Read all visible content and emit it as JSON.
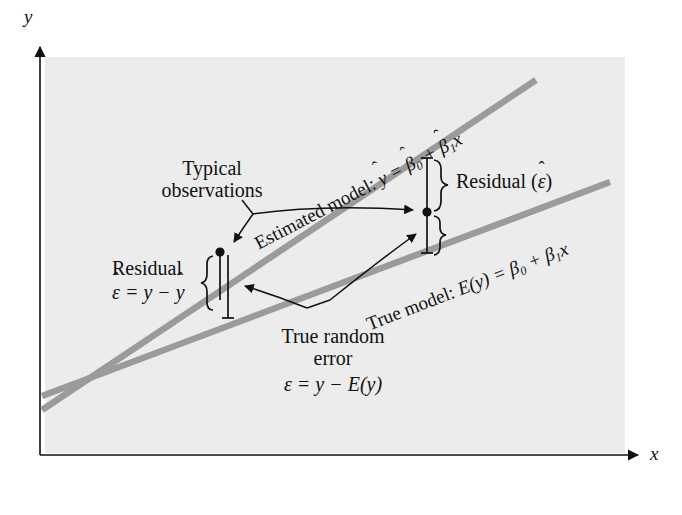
{
  "figure": {
    "type": "diagram",
    "background_color": "#ffffff",
    "plot_area_color": "#ececec",
    "line_color": "#9b9b9b",
    "ink_color": "#111111"
  },
  "axes": {
    "y_label": "y",
    "x_label": "x",
    "y_axis_name": "vertical-axis",
    "x_axis_name": "horizontal-axis"
  },
  "lines": [
    {
      "id": "estimated-model-line",
      "label_prefix": "Estimated model:",
      "equation_plain": "ŷ = β̂0 + β̂1x",
      "lhs": "y",
      "lhs_hat": "ˆ",
      "eq": " = ",
      "b0": "β",
      "b0_sub": "0",
      "b0_hat": "ˆ",
      "plus": " + ",
      "b1": "β",
      "b1_sub": "1",
      "b1_hat": "ˆ",
      "x": "x"
    },
    {
      "id": "true-model-line",
      "label_prefix": "True model:",
      "equation_plain": "E(y) = β0 + β1x",
      "lhs": "E(y)",
      "eq": " = ",
      "b0": "β",
      "b0_sub": "0",
      "plus": " + ",
      "b1": "β",
      "b1_sub": "1",
      "x": "x"
    }
  ],
  "annotations": {
    "typical_observations": {
      "line1": "Typical",
      "line2": "observations"
    },
    "residual_right": {
      "text": "Residual (",
      "symbol": "ε",
      "hat": "ˆ",
      "close": ")"
    },
    "residual_left": {
      "word": "Residual",
      "brace": "{",
      "eq_sym": "ε",
      "eq_hat": "ˆ",
      "eq_mid": " = y − ",
      "eq_yhat": "y",
      "eq_yhat_mark": "ˆ"
    },
    "true_random_error": {
      "line1": "True random",
      "line2": "error",
      "eq_sym": "ε",
      "eq_rest": " = y − E(y)"
    }
  },
  "data_points": [
    {
      "name": "left-observation-point",
      "x": 220,
      "y": 252
    },
    {
      "name": "right-observation-point",
      "x": 427,
      "y": 212
    }
  ]
}
